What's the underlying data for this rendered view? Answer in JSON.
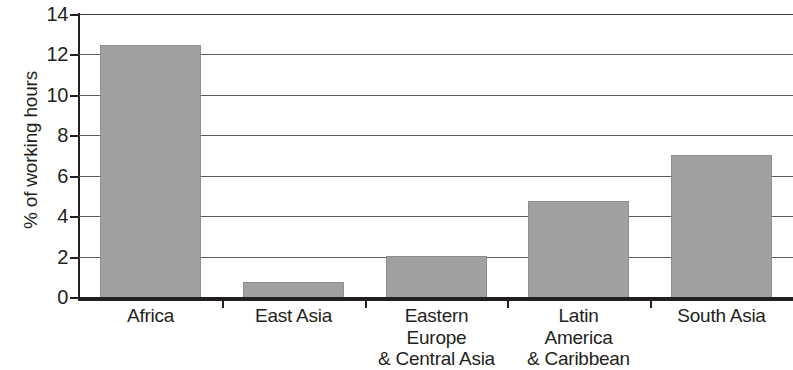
{
  "chart_data": {
    "type": "bar",
    "title": "",
    "xlabel": "",
    "ylabel": "% of working hours",
    "ylim": [
      0,
      14
    ],
    "yticks": [
      0,
      2,
      4,
      6,
      8,
      10,
      12,
      14
    ],
    "ytick_labels": [
      "0",
      "2",
      "4",
      "6",
      "8",
      "10",
      "12",
      "14"
    ],
    "grid": "horizontal",
    "legend": "none",
    "bar_color": "#a0a0a0",
    "bar_edge_color": "#8e8e8e",
    "axis_color": "#231f20",
    "gridline_color": "#5b5b5b",
    "categories": [
      "Africa",
      "Eastern Europe & Central Asia",
      "East Asia",
      "Latin America & Caribbean",
      "South Asia"
    ],
    "category_labels": [
      [
        "Africa"
      ],
      [
        "East Asia"
      ],
      [
        "Eastern",
        "Europe",
        "& Central Asia"
      ],
      [
        "Latin",
        "America",
        "& Caribbean"
      ],
      [
        "South Asia"
      ]
    ],
    "values": [
      12.45,
      0.75,
      2.05,
      4.75,
      7.0
    ],
    "points": [
      {
        "category": "Africa",
        "value": 12.45
      },
      {
        "category": "East Asia",
        "value": 0.75
      },
      {
        "category": "Eastern Europe & Central Asia",
        "value": 2.05
      },
      {
        "category": "Latin America & Caribbean",
        "value": 4.75
      },
      {
        "category": "South Asia",
        "value": 7.0
      }
    ]
  }
}
